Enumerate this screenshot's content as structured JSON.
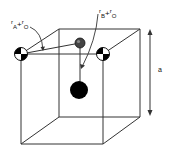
{
  "diagram": {
    "type": "perovskite-unit-cell",
    "labels": {
      "a_site_radius": {
        "r": "r",
        "sub1": "A",
        "plus": "+",
        "r2": "r",
        "sub2": "O"
      },
      "b_site_radius": {
        "r": "r",
        "sub1": "B",
        "plus": "+",
        "r2": "r",
        "sub2": "O"
      },
      "lattice": "a"
    },
    "colors": {
      "line": "#333333",
      "b_cation": "#000000",
      "oxygen_sphere": "#333333",
      "quartered_fill": "#000000",
      "background": "#ffffff"
    }
  }
}
